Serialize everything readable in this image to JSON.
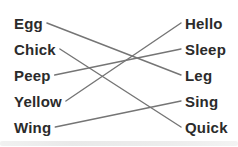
{
  "worksheet": {
    "left_words": [
      "Egg",
      "Chick",
      "Peep",
      "Yellow",
      "Wing"
    ],
    "right_words": [
      "Hello",
      "Sleep",
      "Leg",
      "Sing",
      "Quick"
    ],
    "connections": [
      {
        "left_word": "Egg",
        "right_word": "Leg",
        "left_index": 0,
        "right_index": 2
      },
      {
        "left_word": "Chick",
        "right_word": "Quick",
        "left_index": 1,
        "right_index": 4
      },
      {
        "left_word": "Peep",
        "right_word": "Sleep",
        "left_index": 2,
        "right_index": 1
      },
      {
        "left_word": "Yellow",
        "right_word": "Hello",
        "left_index": 3,
        "right_index": 0
      },
      {
        "left_word": "Wing",
        "right_word": "Sing",
        "left_index": 4,
        "right_index": 3
      }
    ],
    "colors": {
      "line": "#757575",
      "text": "#2b2b2b",
      "background": "#ffffff",
      "scan_shadow": "#e4e4e4"
    }
  }
}
